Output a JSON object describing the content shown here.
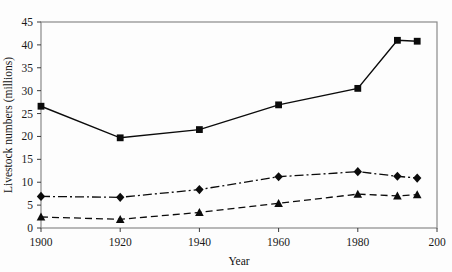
{
  "chart_data": {
    "type": "line",
    "title": "",
    "xlabel": "Year",
    "ylabel": "Livestock numbers (millions)",
    "x": [
      1900,
      1920,
      1940,
      1960,
      1980,
      1990,
      1995
    ],
    "xlim": [
      1900,
      2000
    ],
    "ylim": [
      0,
      45
    ],
    "xticks": [
      1900,
      1920,
      1940,
      1960,
      1980,
      2000
    ],
    "xtick_labels": [
      "1900",
      "1920",
      "1940",
      "1960",
      "1980",
      "200"
    ],
    "yticks": [
      0,
      5,
      10,
      15,
      20,
      25,
      30,
      35,
      40,
      45
    ],
    "ytick_labels": [
      "0",
      "5",
      "10",
      "15",
      "20",
      "25",
      "30",
      "35",
      "40",
      "45"
    ],
    "grid": false,
    "legend": "none",
    "series": [
      {
        "name": "series-squares",
        "marker": "square",
        "linestyle": "solid",
        "color": "#0b0b0b",
        "values": [
          26.6,
          19.7,
          21.5,
          26.9,
          30.5,
          41.0,
          40.8
        ]
      },
      {
        "name": "series-diamonds",
        "marker": "diamond",
        "linestyle": "dashdot",
        "color": "#0b0b0b",
        "values": [
          6.9,
          6.7,
          8.4,
          11.2,
          12.3,
          11.3,
          10.9
        ]
      },
      {
        "name": "series-triangles",
        "marker": "triangle",
        "linestyle": "dashed",
        "color": "#0b0b0b",
        "values": [
          2.4,
          1.9,
          3.4,
          5.4,
          7.4,
          7.0,
          7.3
        ]
      }
    ]
  },
  "figure": {
    "background": "#fdfdfd",
    "frame_color": "#8a8a8a",
    "ink_color": "#0b0b0b"
  }
}
